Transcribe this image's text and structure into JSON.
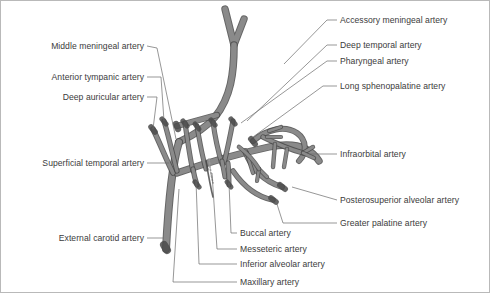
{
  "figure": {
    "background_color": "#ffffff",
    "border_color": "#b9b9b9",
    "vessel_fill": "#8a8a8a",
    "vessel_stroke": "#4a4a4a",
    "leader_color": "#6a6a6a",
    "text_color": "#3b3b3b"
  },
  "labels_left": [
    {
      "id": "middle-meningeal-artery",
      "text": "Middle meningeal artery",
      "x": 143,
      "y": 45,
      "lx": 175,
      "ly": 138
    },
    {
      "id": "anterior-tympanic-artery",
      "text": "Anterior tympanic artery",
      "x": 143,
      "y": 76,
      "lx": 163,
      "ly": 120
    },
    {
      "id": "deep-auricular-artery",
      "text": "Deep auricular artery",
      "x": 143,
      "y": 96,
      "lx": 152,
      "ly": 128
    },
    {
      "id": "superficial-temporal-artery",
      "text": "Superficial temporal artery",
      "x": 143,
      "y": 162,
      "lx": 168,
      "ly": 162
    },
    {
      "id": "external-carotid-artery",
      "text": "External carotid artery",
      "x": 143,
      "y": 237,
      "lx": 162,
      "ly": 237
    }
  ],
  "labels_right": [
    {
      "id": "accessory-meningeal-artery",
      "text": "Accessory meningeal artery",
      "x": 339,
      "y": 19,
      "lx": 283,
      "ly": 63
    },
    {
      "id": "deep-temporal-artery",
      "text": "Deep temporal artery",
      "x": 339,
      "y": 44,
      "lx": 246,
      "ly": 120
    },
    {
      "id": "pharyngeal-artery",
      "text": "Pharyngeal artery",
      "x": 339,
      "y": 60,
      "lx": 240,
      "ly": 122
    },
    {
      "id": "long-sphenopalatine-artery",
      "text": "Long sphenopalatine artery",
      "x": 339,
      "y": 85,
      "lx": 252,
      "ly": 136
    },
    {
      "id": "infraorbital-artery",
      "text": "Infraorbital artery",
      "x": 339,
      "y": 153,
      "lx": 306,
      "ly": 153
    },
    {
      "id": "posterosuperior-alveolar-artery",
      "text": "Posterosuperior alveolar artery",
      "x": 339,
      "y": 199,
      "lx": 291,
      "ly": 186
    },
    {
      "id": "greater-palatine-artery",
      "text": "Greater palatine artery",
      "x": 339,
      "y": 222,
      "lx": 275,
      "ly": 199
    }
  ],
  "labels_bottom": [
    {
      "id": "buccal-artery",
      "text": "Buccal artery",
      "x": 239,
      "y": 232,
      "lx": 228,
      "ly": 182
    },
    {
      "id": "messeteric-artery",
      "text": "Messeteric artery",
      "x": 239,
      "y": 248,
      "lx": 211,
      "ly": 172
    },
    {
      "id": "inferior-alveolar-artery",
      "text": "Inferior alveolar artery",
      "x": 239,
      "y": 263,
      "lx": 195,
      "ly": 180
    },
    {
      "id": "maxillary-artery",
      "text": "Maxillary artery",
      "x": 239,
      "y": 281,
      "lx": 178,
      "ly": 186
    }
  ]
}
